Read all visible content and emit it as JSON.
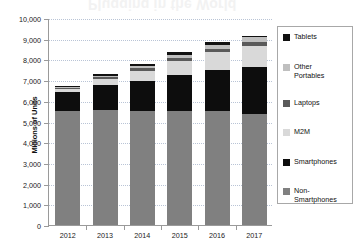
{
  "ghost_text": "Plugging in the World",
  "chart_data": {
    "type": "bar",
    "subtype": "stacked",
    "title": "",
    "xlabel": "",
    "ylabel": "Millions of Units",
    "categories": [
      "2012",
      "2013",
      "2014",
      "2015",
      "2016",
      "2017"
    ],
    "ylim": [
      0,
      10000
    ],
    "ytick_step": 1000,
    "ytick_labels": [
      "0",
      "1,000",
      "2,000",
      "3,000",
      "4,000",
      "5,000",
      "6,000",
      "7,000",
      "8,000",
      "9,000",
      "10,000"
    ],
    "grid": true,
    "legend_position": "right",
    "series": [
      {
        "name": "Non-Smartphones",
        "color": "#808080",
        "values": [
          5500,
          5570,
          5520,
          5510,
          5500,
          5340
        ]
      },
      {
        "name": "Smartphones",
        "color": "#0d0d0d",
        "values": [
          950,
          1210,
          1460,
          1740,
          2000,
          2280
        ]
      },
      {
        "name": "M2M",
        "color": "#d9d9d9",
        "values": [
          120,
          260,
          480,
          680,
          860,
          1040
        ]
      },
      {
        "name": "Laptops",
        "color": "#5a5a5a",
        "values": [
          60,
          90,
          110,
          130,
          150,
          180
        ]
      },
      {
        "name": "Other Portables",
        "color": "#bfbfbf",
        "values": [
          50,
          80,
          110,
          150,
          190,
          230
        ]
      },
      {
        "name": "Tablets",
        "color": "#111111",
        "values": [
          40,
          90,
          120,
          150,
          130,
          80
        ]
      }
    ],
    "totals": [
      6720,
      7300,
      7800,
      8360,
      8830,
      9150
    ],
    "legend_order": [
      "Tablets",
      "Other Portables",
      "Laptops",
      "M2M",
      "Smartphones",
      "Non-Smartphones"
    ]
  }
}
